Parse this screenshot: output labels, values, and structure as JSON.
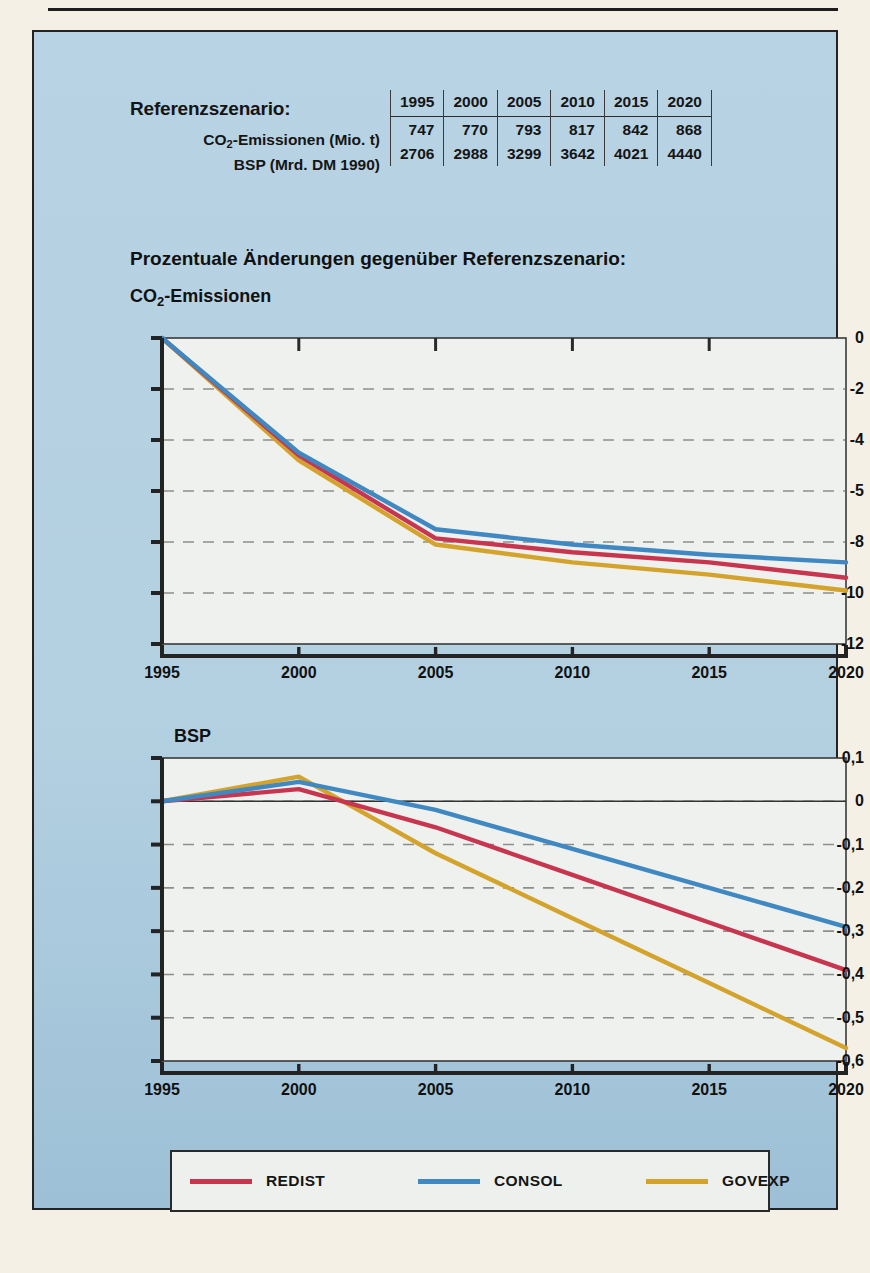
{
  "reference": {
    "title": "Referenzszenario:",
    "years": [
      "1995",
      "2000",
      "2005",
      "2010",
      "2015",
      "2020"
    ],
    "rows": [
      {
        "label_pre": "CO",
        "label_sub": "2",
        "label_post": "-Emissionen (Mio. t)",
        "values": [
          "747",
          "770",
          "793",
          "817",
          "842",
          "868"
        ]
      },
      {
        "label_pre": "BSP (Mrd. DM 1990)",
        "label_sub": "",
        "label_post": "",
        "values": [
          "2706",
          "2988",
          "3299",
          "3642",
          "4021",
          "4440"
        ]
      }
    ]
  },
  "headings": {
    "percent_changes": "Prozentuale Änderungen gegenüber Referenzszenario:",
    "co2_pre": "CO",
    "co2_sub": "2",
    "co2_post": "-Emissionen",
    "bsp": "BSP"
  },
  "colors": {
    "redist": "#c8354f",
    "consol": "#3f88c2",
    "govexp": "#d3a32b",
    "panel_bg": "#b3d0e1",
    "plot_bg": "#eef1ee",
    "axis": "#232323",
    "grid": "#8a8f8d"
  },
  "legend": {
    "items": [
      {
        "label": "REDIST",
        "color_key": "redist"
      },
      {
        "label": "CONSOL",
        "color_key": "consol"
      },
      {
        "label": "GOVEXP",
        "color_key": "govexp"
      }
    ]
  },
  "chart_data": [
    {
      "id": "co2",
      "type": "line",
      "title": "CO2-Emissionen",
      "xlabel": "",
      "ylabel": "",
      "x": [
        1995,
        2000,
        2005,
        2010,
        2015,
        2020
      ],
      "xtick_labels": [
        "1995",
        "2000",
        "2005",
        "2010",
        "2015",
        "2020"
      ],
      "ytick_labels": [
        "0",
        "-2",
        "-4",
        "-5",
        "-8",
        "-10",
        "-12"
      ],
      "ytick_positions": [
        0,
        1,
        2,
        3,
        4,
        5,
        6
      ],
      "ylim_positions": [
        0,
        6
      ],
      "grid": true,
      "grid_style": "dashed-horizontal",
      "legend_position": "below-figure",
      "series": [
        {
          "name": "REDIST",
          "color_key": "redist",
          "values": [
            0,
            -4.6,
            -7.8,
            -8.6,
            -9.1,
            -9.4
          ],
          "plot_positions": [
            0,
            2.3,
            3.93,
            4.2,
            4.4,
            4.7
          ]
        },
        {
          "name": "CONSOL",
          "color_key": "consol",
          "values": [
            0,
            -4.5,
            -7.5,
            -8.1,
            -8.5,
            -8.8
          ],
          "plot_positions": [
            0,
            2.25,
            3.75,
            4.05,
            4.25,
            4.4
          ]
        },
        {
          "name": "GOVEXP",
          "color_key": "govexp",
          "values": [
            0,
            -4.8,
            -8.1,
            -9.0,
            -9.5,
            -9.9
          ],
          "plot_positions": [
            0,
            2.4,
            4.05,
            4.4,
            4.64,
            4.95
          ]
        }
      ]
    },
    {
      "id": "bsp",
      "type": "line",
      "title": "BSP",
      "xlabel": "",
      "ylabel": "",
      "x": [
        1995,
        2000,
        2005,
        2010,
        2015,
        2020
      ],
      "xtick_labels": [
        "1995",
        "2000",
        "2005",
        "2010",
        "2015",
        "2020"
      ],
      "ytick_labels": [
        "0,1",
        "0",
        "-0,1",
        "-0,2",
        "-0,3",
        "-0,4",
        "-0,5",
        "-0,6"
      ],
      "ylim": [
        -0.6,
        0.1
      ],
      "grid": true,
      "grid_style": "dashed-horizontal",
      "legend_position": "below-figure",
      "series": [
        {
          "name": "REDIST",
          "color_key": "redist",
          "values": [
            0,
            0.028,
            -0.06,
            -0.17,
            -0.28,
            -0.39
          ]
        },
        {
          "name": "CONSOL",
          "color_key": "consol",
          "values": [
            0,
            0.045,
            -0.02,
            -0.11,
            -0.2,
            -0.29
          ]
        },
        {
          "name": "GOVEXP",
          "color_key": "govexp",
          "values": [
            0,
            0.057,
            -0.12,
            -0.27,
            -0.42,
            -0.57
          ]
        }
      ]
    }
  ]
}
